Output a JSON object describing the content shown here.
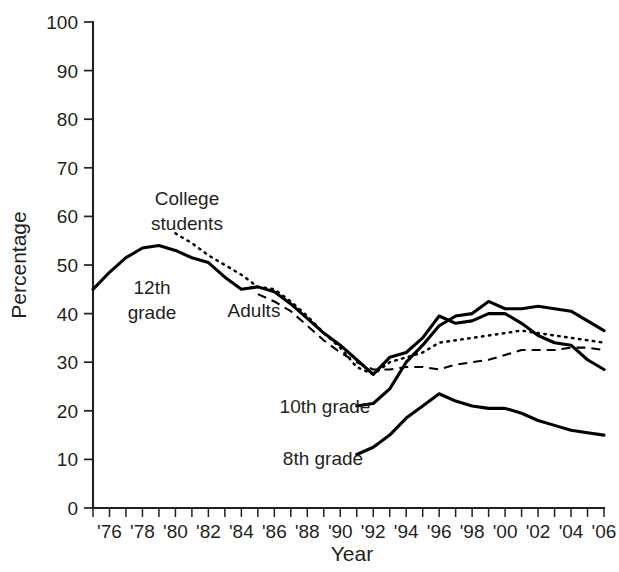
{
  "chart_data": {
    "type": "line",
    "title": "",
    "xlabel": "Year",
    "ylabel": "Percentage",
    "xlim": [
      1975,
      2006
    ],
    "ylim": [
      0,
      100
    ],
    "grid": false,
    "legend_position": "inline-annotations",
    "y_ticks": [
      0,
      10,
      20,
      30,
      40,
      50,
      60,
      70,
      80,
      90,
      100
    ],
    "y_tick_labels": [
      "0",
      "10",
      "20",
      "30",
      "40",
      "50",
      "60",
      "70",
      "80",
      "90",
      "100"
    ],
    "x_ticks": [
      1975,
      1976,
      1977,
      1978,
      1979,
      1980,
      1981,
      1982,
      1983,
      1984,
      1985,
      1986,
      1987,
      1988,
      1989,
      1990,
      1991,
      1992,
      1993,
      1994,
      1995,
      1996,
      1997,
      1998,
      1999,
      2000,
      2001,
      2002,
      2003,
      2004,
      2005,
      2006
    ],
    "x_tick_labels": [
      {
        "year": 1976,
        "label": "'76"
      },
      {
        "year": 1978,
        "label": "'78"
      },
      {
        "year": 1980,
        "label": "'80"
      },
      {
        "year": 1982,
        "label": "'82"
      },
      {
        "year": 1984,
        "label": "'84"
      },
      {
        "year": 1986,
        "label": "'86"
      },
      {
        "year": 1988,
        "label": "'88"
      },
      {
        "year": 1990,
        "label": "'90"
      },
      {
        "year": 1992,
        "label": "'92"
      },
      {
        "year": 1994,
        "label": "'94"
      },
      {
        "year": 1996,
        "label": "'96"
      },
      {
        "year": 1998,
        "label": "'98"
      },
      {
        "year": 2000,
        "label": "'00"
      },
      {
        "year": 2002,
        "label": "'02"
      },
      {
        "year": 2004,
        "label": "'04"
      },
      {
        "year": 2006,
        "label": "'06"
      }
    ],
    "series": [
      {
        "name": "12th grade",
        "style": "solid",
        "x": [
          1975,
          1976,
          1977,
          1978,
          1979,
          1980,
          1981,
          1982,
          1983,
          1984,
          1985,
          1986,
          1987,
          1988,
          1989,
          1990,
          1991,
          1992,
          1993,
          1994,
          1995,
          1996,
          1997,
          1998,
          1999,
          2000,
          2001,
          2002,
          2003,
          2004,
          2005,
          2006
        ],
        "values": [
          45.0,
          48.5,
          51.5,
          53.5,
          54.0,
          53.0,
          51.5,
          50.5,
          47.5,
          45.0,
          45.5,
          44.5,
          42.0,
          39.0,
          36.0,
          33.5,
          30.5,
          27.5,
          31.0,
          32.0,
          35.0,
          39.5,
          38.0,
          38.5,
          40.0,
          40.0,
          38.0,
          35.5,
          34.0,
          33.5,
          30.5,
          28.5
        ]
      },
      {
        "name": "College students",
        "style": "dotted",
        "x": [
          1980,
          1981,
          1982,
          1983,
          1984,
          1985,
          1986,
          1987,
          1988,
          1989,
          1990,
          1991,
          1992,
          1993,
          1994,
          1995,
          1996,
          1997,
          1998,
          1999,
          2000,
          2001,
          2002,
          2003,
          2004,
          2005,
          2006
        ],
        "values": [
          56.5,
          54.5,
          52.0,
          50.0,
          48.0,
          45.5,
          45.0,
          42.5,
          39.5,
          36.0,
          33.0,
          29.0,
          27.5,
          30.0,
          31.0,
          32.0,
          34.0,
          34.5,
          35.0,
          35.5,
          36.0,
          36.5,
          36.0,
          35.5,
          35.0,
          34.5,
          34.0
        ]
      },
      {
        "name": "Adults",
        "style": "dashed",
        "x": [
          1985,
          1986,
          1987,
          1988,
          1989,
          1990,
          1991,
          1992,
          1993,
          1994,
          1995,
          1996,
          1997,
          1998,
          1999,
          2000,
          2001,
          2002,
          2003,
          2004,
          2005,
          2006
        ],
        "values": [
          44.0,
          42.5,
          40.5,
          37.5,
          34.5,
          32.0,
          30.0,
          28.5,
          28.5,
          29.0,
          29.0,
          28.5,
          29.5,
          30.0,
          30.5,
          31.5,
          32.5,
          32.5,
          32.5,
          33.0,
          33.0,
          32.5
        ]
      },
      {
        "name": "10th grade",
        "style": "solid",
        "x": [
          1991,
          1992,
          1993,
          1994,
          1995,
          1996,
          1997,
          1998,
          1999,
          2000,
          2001,
          2002,
          2003,
          2004,
          2005,
          2006
        ],
        "values": [
          21.0,
          21.5,
          24.5,
          30.0,
          33.5,
          37.5,
          39.5,
          40.0,
          42.5,
          41.0,
          41.0,
          41.5,
          41.0,
          40.5,
          38.5,
          36.5
        ]
      },
      {
        "name": "8th grade",
        "style": "solid",
        "x": [
          1991,
          1992,
          1993,
          1994,
          1995,
          1996,
          1997,
          1998,
          1999,
          2000,
          2001,
          2002,
          2003,
          2004,
          2005,
          2006
        ],
        "values": [
          11.0,
          12.5,
          15.0,
          18.5,
          21.0,
          23.5,
          22.0,
          21.0,
          20.5,
          20.5,
          19.5,
          18.0,
          17.0,
          16.0,
          15.5,
          15.0
        ]
      }
    ],
    "annotations": [
      {
        "name": "college-students",
        "text_line_1": "College",
        "text_line_2": "students",
        "x": 187,
        "y": 205
      },
      {
        "name": "twelfth-grade",
        "text_line_1": "12th",
        "text_line_2": "grade",
        "x": 152,
        "y": 294
      },
      {
        "name": "adults",
        "text_line_1": "Adults",
        "text_line_2": "",
        "x": 254,
        "y": 317
      },
      {
        "name": "tenth-grade",
        "text_line_1": "10th grade",
        "text_line_2": "",
        "x": 325,
        "y": 413
      },
      {
        "name": "eighth-grade",
        "text_line_1": "8th grade",
        "text_line_2": "",
        "x": 323,
        "y": 465
      }
    ],
    "colors": {
      "line": "#000000",
      "axis": "#231f20",
      "background": "#ffffff"
    }
  }
}
